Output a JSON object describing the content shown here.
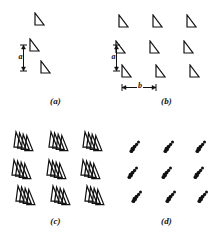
{
  "figure": {
    "type": "diagram",
    "ink_color": "#111111",
    "background_color": "#ffffff",
    "panels": [
      {
        "id": "a",
        "caption": "(a)",
        "marker_shape": "right-triangle",
        "marker_count": 3,
        "arrangement": "staggered diagonal column",
        "markers": [
          {
            "x": 33,
            "y": 12,
            "w": 13,
            "h": 15
          },
          {
            "x": 28,
            "y": 38,
            "w": 13,
            "h": 15
          },
          {
            "x": 39,
            "y": 60,
            "w": 13,
            "h": 15
          }
        ],
        "annotations": [
          {
            "name": "spacing-a",
            "label": "a",
            "orientation": "vertical",
            "x": 19,
            "y": 44,
            "length": 28
          }
        ]
      },
      {
        "id": "b",
        "caption": "(b)",
        "marker_shape": "right-triangle",
        "marker_count": 9,
        "arrangement": "3 x 3 grid",
        "grid": {
          "rows": 3,
          "cols": 3,
          "col_x": [
            6,
            40,
            74
          ],
          "row_y": [
            14,
            40,
            64
          ],
          "row_offset": [
            0,
            -3,
            3
          ]
        },
        "marker_size": {
          "w": 13,
          "h": 15
        },
        "annotations": [
          {
            "name": "spacing-a",
            "label": "a",
            "orientation": "vertical",
            "x": 1,
            "y": 44,
            "length": 28
          },
          {
            "name": "spacing-b",
            "label": "b",
            "orientation": "horizontal",
            "x": 10,
            "y": 83,
            "length": 36
          }
        ]
      },
      {
        "id": "c",
        "caption": "(c)",
        "marker_shape": "triangle-cluster",
        "marker_count": 9,
        "cluster_triangles": 4,
        "arrangement": "3 x 3 grid of layered triangle clusters",
        "grid": {
          "rows": 3,
          "cols": 3,
          "col_x": [
            13,
            48,
            82
          ],
          "row_y": [
            8,
            36,
            62
          ],
          "row_offset": [
            0,
            -2,
            2
          ]
        },
        "marker_size": {
          "w": 24,
          "h": 22
        }
      },
      {
        "id": "d",
        "caption": "(d)",
        "marker_shape": "dot-streak",
        "marker_count": 9,
        "arrangement": "3 x 3 grid of small diagonal dot streaks",
        "grid": {
          "rows": 3,
          "cols": 3,
          "col_x": [
            18,
            52,
            84
          ],
          "row_y": [
            18,
            44,
            68
          ],
          "row_offset": [
            0,
            -2,
            2
          ]
        },
        "marker_size": {
          "w": 12,
          "h": 14
        }
      }
    ]
  }
}
